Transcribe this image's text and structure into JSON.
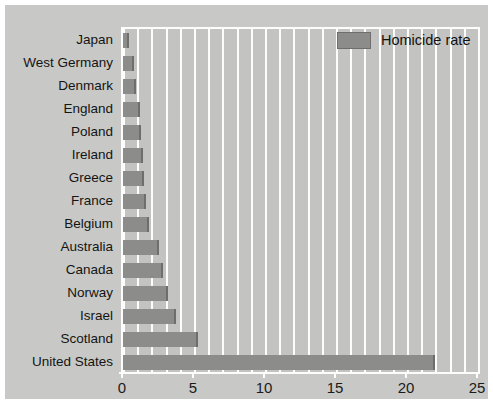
{
  "chart_data": {
    "type": "bar",
    "orientation": "horizontal",
    "title": "",
    "subtitle": "",
    "xlabel": "",
    "ylabel": "",
    "xlim": [
      0,
      25
    ],
    "xticks": [
      0,
      5,
      10,
      15,
      20,
      25
    ],
    "xtick_labels": [
      "0",
      "5",
      "10",
      "15",
      "20",
      "25"
    ],
    "minor_gridlines_step": 1,
    "grid": true,
    "grid_color": "#fdfdfd",
    "legend": {
      "position": "top-right",
      "entries": [
        {
          "name": "Homicide rate",
          "color": "#8c8d8a"
        }
      ]
    },
    "series": [
      {
        "name": "Homicide rate",
        "color": "#8c8d8a",
        "values": [
          0.4,
          0.8,
          0.9,
          1.2,
          1.3,
          1.4,
          1.5,
          1.6,
          1.8,
          2.5,
          2.8,
          3.2,
          3.7,
          5.3,
          22.0
        ]
      }
    ],
    "categories": [
      "Japan",
      "West Germany",
      "Denmark",
      "England",
      "Poland",
      "Ireland",
      "Greece",
      "France",
      "Belgium",
      "Australia",
      "Canada",
      "Norway",
      "Israel",
      "Scotland",
      "United States"
    ]
  },
  "colors": {
    "figure_background": "#ffffff",
    "canvas_background": "#c8c9c6",
    "plot_background": "#c3c4c1",
    "bar_fill": "#8c8d8a",
    "bar_edge": "#6e6f6c",
    "grid": "#fdfdfd",
    "text": "#141414"
  }
}
